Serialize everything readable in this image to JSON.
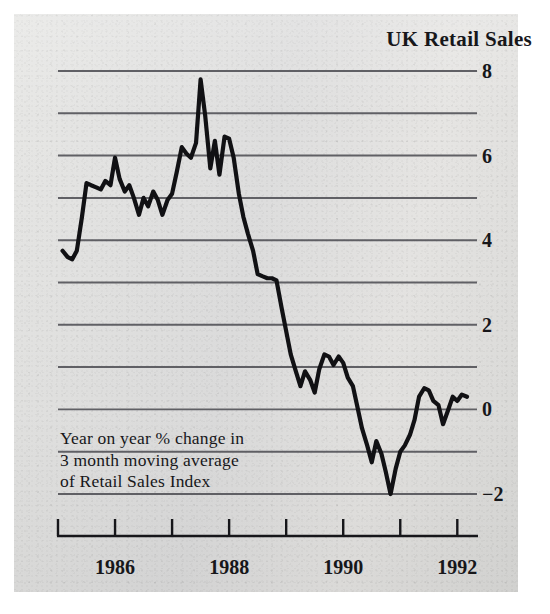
{
  "chart_data": {
    "type": "line",
    "title": "UK Retail Sales",
    "annotation": "Year on year % change in\n3 month moving average\nof Retail Sales Index",
    "xlabel": "",
    "ylabel": "",
    "xlim": [
      1985.0,
      1992.17
    ],
    "ylim": [
      -2.6,
      8.4
    ],
    "grid": true,
    "gridlines_y": [
      -2,
      -1,
      0,
      1,
      2,
      3,
      4,
      5,
      6,
      7,
      8
    ],
    "ytick_labels": [
      "8",
      "6",
      "4",
      "2",
      "0",
      "−2"
    ],
    "ytick_values": [
      8,
      6,
      4,
      2,
      0,
      -2
    ],
    "xtick_values": [
      1985,
      1986,
      1987,
      1988,
      1989,
      1990,
      1991,
      1992
    ],
    "xtick_labels": [
      "1986",
      "1988",
      "1990",
      "1992"
    ],
    "xtick_label_values": [
      1986,
      1988,
      1990,
      1992
    ],
    "legend": [],
    "legend_position": "none",
    "line_color": "#111114",
    "grid_color": "#55555a",
    "series": [
      {
        "name": "UK Retail Sales year on year % change (3 month moving average)",
        "x": [
          1985.08,
          1985.17,
          1985.25,
          1985.33,
          1985.42,
          1985.5,
          1985.58,
          1985.67,
          1985.75,
          1985.83,
          1985.92,
          1986.0,
          1986.08,
          1986.17,
          1986.25,
          1986.33,
          1986.42,
          1986.5,
          1986.58,
          1986.67,
          1986.75,
          1986.83,
          1986.92,
          1987.0,
          1987.08,
          1987.17,
          1987.25,
          1987.33,
          1987.42,
          1987.5,
          1987.58,
          1987.67,
          1987.75,
          1987.83,
          1987.92,
          1988.0,
          1988.08,
          1988.17,
          1988.25,
          1988.33,
          1988.42,
          1988.5,
          1988.58,
          1988.67,
          1988.75,
          1988.83,
          1988.92,
          1989.0,
          1989.08,
          1989.17,
          1989.25,
          1989.33,
          1989.42,
          1989.5,
          1989.58,
          1989.67,
          1989.75,
          1989.83,
          1989.92,
          1990.0,
          1990.08,
          1990.17,
          1990.25,
          1990.33,
          1990.42,
          1990.5,
          1990.58,
          1990.67,
          1990.75,
          1990.83,
          1990.92,
          1991.0,
          1991.08,
          1991.17,
          1991.25,
          1991.33,
          1991.42,
          1991.5,
          1991.58,
          1991.67,
          1991.75,
          1991.83,
          1991.92,
          1992.0,
          1992.08,
          1992.17
        ],
        "y": [
          3.75,
          3.6,
          3.55,
          3.75,
          4.55,
          5.35,
          5.3,
          5.25,
          5.2,
          5.4,
          5.3,
          5.95,
          5.45,
          5.15,
          5.3,
          5.0,
          4.6,
          5.0,
          4.8,
          5.15,
          4.95,
          4.6,
          4.95,
          5.1,
          5.6,
          6.2,
          6.05,
          5.95,
          6.3,
          7.8,
          6.95,
          5.7,
          6.35,
          5.55,
          6.45,
          6.4,
          5.95,
          5.1,
          4.55,
          4.15,
          3.75,
          3.2,
          3.15,
          3.1,
          3.1,
          3.05,
          2.4,
          1.85,
          1.3,
          0.9,
          0.55,
          0.9,
          0.7,
          0.4,
          0.95,
          1.3,
          1.25,
          1.05,
          1.25,
          1.1,
          0.75,
          0.55,
          0.05,
          -0.45,
          -0.85,
          -1.25,
          -0.75,
          -1.05,
          -1.5,
          -2.0,
          -1.4,
          -1.0,
          -0.85,
          -0.6,
          -0.25,
          0.3,
          0.5,
          0.45,
          0.2,
          0.1,
          -0.35,
          -0.05,
          0.3,
          0.2,
          0.35,
          0.3
        ]
      }
    ]
  }
}
